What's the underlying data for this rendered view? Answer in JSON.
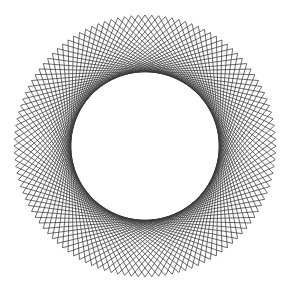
{
  "figure": {
    "title": "",
    "pattern": {
      "type": "chord-envelope",
      "point_count": 120,
      "chord_step": 37,
      "line_color": "#3a3a3a",
      "background_color": "#ffffff"
    }
  }
}
